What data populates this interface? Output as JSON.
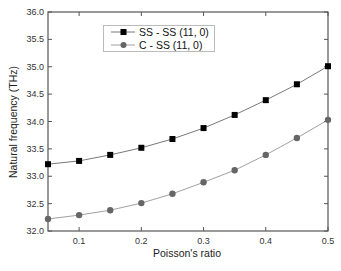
{
  "chart_data": {
    "type": "line",
    "title": "",
    "xlabel": "Poisson's ratio",
    "ylabel": "Natural frequency (THz)",
    "xlim": [
      0.05,
      0.5
    ],
    "ylim": [
      32.0,
      36.0
    ],
    "x_ticks": [
      0.1,
      0.2,
      0.3,
      0.4,
      0.5
    ],
    "x_tick_labels": [
      "0.1",
      "0.2",
      "0.3",
      "0.4",
      "0.5"
    ],
    "y_ticks": [
      32.0,
      32.5,
      33.0,
      33.5,
      34.0,
      34.5,
      35.0,
      35.5,
      36.0
    ],
    "y_tick_labels": [
      "32.0",
      "32.5",
      "33.0",
      "33.5",
      "34.0",
      "34.5",
      "35.0",
      "35.5",
      "36.0"
    ],
    "grid": false,
    "legend_position": "upper-left-center",
    "x": [
      0.05,
      0.1,
      0.15,
      0.2,
      0.25,
      0.3,
      0.35,
      0.4,
      0.45,
      0.5
    ],
    "series": [
      {
        "name": "SS - SS (11, 0)",
        "marker": "square",
        "color": "#000000",
        "line_color": "#555555",
        "values": [
          33.22,
          33.28,
          33.39,
          33.52,
          33.68,
          33.88,
          34.12,
          34.39,
          34.68,
          35.01
        ]
      },
      {
        "name": "C - SS (11, 0)",
        "marker": "circle",
        "color": "#666666",
        "line_color": "#888888",
        "values": [
          32.22,
          32.29,
          32.38,
          32.51,
          32.68,
          32.89,
          33.11,
          33.39,
          33.7,
          34.03
        ]
      }
    ]
  }
}
